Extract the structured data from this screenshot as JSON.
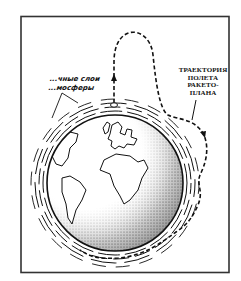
{
  "figure": {
    "type": "illustration",
    "labels": {
      "trajectory": [
        "ТРАЕКТОРИЯ",
        "ПОЛЕТА",
        "РАКЕТО-",
        "ПЛАНА"
      ],
      "atmosphere_layers": [
        "...чные слои",
        "...мосферы"
      ]
    },
    "colors": {
      "ink": "#111111",
      "background": "#ffffff",
      "frame": "#333333"
    }
  }
}
